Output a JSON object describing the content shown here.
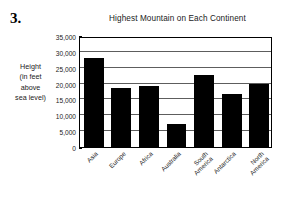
{
  "problem": {
    "number": "3."
  },
  "chart_data": {
    "type": "bar",
    "title": "Highest Mountain on Each Continent",
    "xlabel": "",
    "ylabel": "Height (in feet above sea level)",
    "ylabel_lines": [
      "Height",
      "(in feet",
      "above",
      "sea level)"
    ],
    "categories": [
      "Asia",
      "Europe",
      "Africa",
      "Australia",
      "South America",
      "Antarctica",
      "North America"
    ],
    "category_lines": [
      [
        "Asia"
      ],
      [
        "Europe"
      ],
      [
        "Africa"
      ],
      [
        "Australia"
      ],
      [
        "South",
        "America"
      ],
      [
        "Antarctica"
      ],
      [
        "North",
        "America"
      ]
    ],
    "values": [
      28000,
      18500,
      19300,
      7300,
      22800,
      16800,
      19800
    ],
    "ylim": [
      0,
      35000
    ],
    "ytick_values": [
      0,
      5000,
      10000,
      15000,
      20000,
      25000,
      30000,
      35000
    ],
    "ytick_labels": [
      "0",
      "5,000",
      "10,000",
      "15,000",
      "20,000",
      "25,000",
      "30,000",
      "35,000"
    ],
    "grid": true,
    "legend": false,
    "bar_color": "#000000",
    "grid_color": "#5d5d5d",
    "frame_color": "#000000",
    "background": "#ffffff"
  }
}
